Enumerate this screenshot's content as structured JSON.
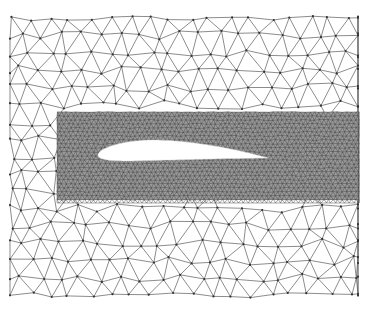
{
  "figure": {
    "title": "Unstructured triangular mesh around an airfoil",
    "width": 371,
    "height": 309,
    "background": "#ffffff",
    "line_color": "#5a5a5a",
    "node_color": "#333333",
    "coarse_mesh": {
      "label": "Coarse outer triangular mesh",
      "bounds": {
        "x0": 10,
        "y0": 18,
        "x1": 358,
        "y1": 295
      },
      "spacing": 20,
      "jitter": 4.5,
      "stroke_width": 0.7
    },
    "fine_mesh": {
      "label": "Refined mesh band around airfoil",
      "bounds": {
        "x0": 57,
        "y0": 112,
        "x1": 359,
        "y1": 200
      },
      "spacing": 4.6,
      "jitter": 0.6,
      "stroke_width": 0.45,
      "fill": "#9a9a9a"
    },
    "airfoil": {
      "label": "Airfoil (NACA-type) cavity",
      "leading_edge": {
        "x": 98,
        "y": 155
      },
      "trailing_edge": {
        "x": 268,
        "y": 158
      },
      "chord": 170,
      "thickness": 0.12,
      "camber": 0.035,
      "fill": "#ffffff"
    }
  }
}
